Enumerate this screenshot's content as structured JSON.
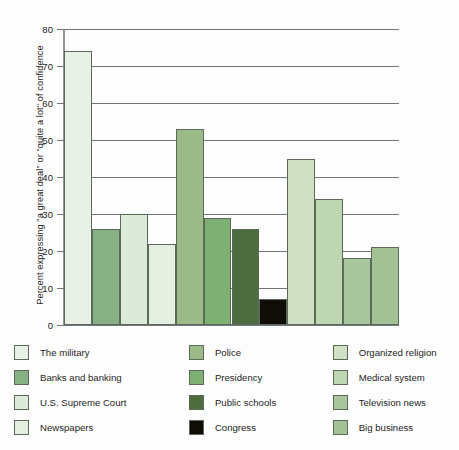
{
  "chart_data": {
    "type": "bar",
    "title": "",
    "xlabel": "",
    "ylabel": "Percent expressing \"a great deal\" or \"quite a lot\" of confidence",
    "ylim": [
      0,
      80
    ],
    "ytick_labels": [
      "80",
      "70",
      "60",
      "50",
      "40",
      "30",
      "20",
      "10",
      "0"
    ],
    "yticks": [
      80,
      70,
      60,
      50,
      40,
      30,
      20,
      10,
      0
    ],
    "grid": true,
    "legend_position": "below",
    "legend_columns": 3,
    "categories": [
      "The military",
      "Banks and banking",
      "U.S. Supreme Court",
      "Newspapers",
      "Police",
      "Presidency",
      "Public schools",
      "Congress",
      "Organized religion",
      "Medical system",
      "Television news",
      "Big business"
    ],
    "values": [
      74,
      26,
      30,
      22,
      53,
      29,
      26,
      7,
      45,
      34,
      18,
      21
    ],
    "colors": [
      "#e9f1e6",
      "#87b184",
      "#dceada",
      "#e4efe1",
      "#9cba87",
      "#7fb073",
      "#4d6c3f",
      "#100d09",
      "#cfe0c4",
      "#bfd6b3",
      "#a8c79c",
      "#a2c295"
    ],
    "bar_edge_color": "#5c6b58"
  },
  "legend": {
    "columns": [
      {
        "items": [
          {
            "label": "The military",
            "color": "#e9f1e6"
          },
          {
            "label": "Banks and banking",
            "color": "#87b184"
          },
          {
            "label": "U.S. Supreme Court",
            "color": "#dceada"
          },
          {
            "label": "Newspapers",
            "color": "#e4efe1"
          }
        ]
      },
      {
        "items": [
          {
            "label": "Police",
            "color": "#9cba87"
          },
          {
            "label": "Presidency",
            "color": "#7fb073"
          },
          {
            "label": "Public schools",
            "color": "#4d6c3f"
          },
          {
            "label": "Congress",
            "color": "#100d09"
          }
        ]
      },
      {
        "items": [
          {
            "label": "Organized religion",
            "color": "#cfe0c4"
          },
          {
            "label": "Medical system",
            "color": "#bfd6b3"
          },
          {
            "label": "Television news",
            "color": "#a8c79c"
          },
          {
            "label": "Big business",
            "color": "#a2c295"
          }
        ]
      }
    ]
  }
}
